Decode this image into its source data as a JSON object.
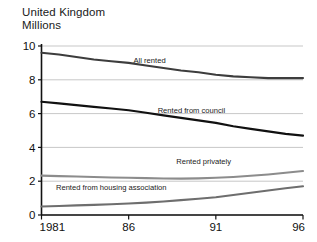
{
  "header": {
    "region": "United Kingdom",
    "units": "Millions"
  },
  "chart_data": {
    "type": "line",
    "title": "United Kingdom",
    "subtitle": "Millions",
    "xlabel": "",
    "ylabel": "Millions",
    "ylim": [
      0,
      10
    ],
    "xlim": [
      1981,
      1996
    ],
    "grid": true,
    "legend_position": "inline-labels",
    "yticks": [
      "0",
      "2",
      "4",
      "6",
      "8",
      "10"
    ],
    "ytick_values": [
      0,
      2,
      4,
      6,
      8,
      10
    ],
    "xticks": [
      "1981",
      "86",
      "91",
      "96"
    ],
    "xtick_values": [
      1981,
      1986,
      1991,
      1996
    ],
    "x": [
      1981,
      1982,
      1983,
      1984,
      1985,
      1986,
      1987,
      1988,
      1989,
      1990,
      1991,
      1992,
      1993,
      1994,
      1995,
      1996
    ],
    "series": [
      {
        "name": "All rented",
        "label": "All rented",
        "color": "#3d3d3d",
        "width": 2.1,
        "values": [
          9.6,
          9.5,
          9.35,
          9.2,
          9.1,
          9.0,
          8.85,
          8.7,
          8.55,
          8.45,
          8.3,
          8.2,
          8.15,
          8.1,
          8.1,
          8.1
        ],
        "label_x": 1987.2,
        "label_y": 9.0
      },
      {
        "name": "Rented from council",
        "label": "Rented from council",
        "color": "#111111",
        "width": 2.2,
        "values": [
          6.7,
          6.6,
          6.5,
          6.4,
          6.3,
          6.2,
          6.05,
          5.9,
          5.75,
          5.6,
          5.45,
          5.25,
          5.1,
          4.95,
          4.8,
          4.7
        ],
        "label_x": 1989.6,
        "label_y": 6.05
      },
      {
        "name": "Rented privately",
        "label": "Rented privately",
        "color": "#8c8c8c",
        "width": 2.1,
        "values": [
          2.33,
          2.3,
          2.28,
          2.25,
          2.22,
          2.2,
          2.18,
          2.16,
          2.15,
          2.17,
          2.2,
          2.25,
          2.32,
          2.4,
          2.5,
          2.6
        ],
        "label_x": 1990.3,
        "label_y": 3.0
      },
      {
        "name": "Rented from housing association",
        "label": "Rented from housing association",
        "color": "#6e6e6e",
        "width": 2.1,
        "values": [
          0.5,
          0.53,
          0.57,
          0.6,
          0.64,
          0.68,
          0.73,
          0.8,
          0.88,
          0.96,
          1.05,
          1.18,
          1.32,
          1.45,
          1.58,
          1.7
        ],
        "label_x": 1985.0,
        "label_y": 1.45
      }
    ]
  }
}
